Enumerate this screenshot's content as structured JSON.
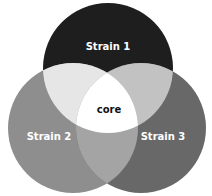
{
  "diagram": {
    "type": "venn-3",
    "sets": [
      {
        "id": "s1",
        "label": "Strain 1",
        "color": "#1e1e1e",
        "label_color": "#ffffff",
        "cx": 108,
        "cy": 68,
        "r": 65
      },
      {
        "id": "s2",
        "label": "Strain 2",
        "color": "#8e8e8e",
        "label_color": "#ffffff",
        "cx": 73,
        "cy": 128,
        "r": 65
      },
      {
        "id": "s3",
        "label": "Strain 3",
        "color": "#686868",
        "label_color": "#ffffff",
        "cx": 141,
        "cy": 128,
        "r": 65
      }
    ],
    "intersections": {
      "s1_s2": {
        "color": "#e6e6e6"
      },
      "s1_s3": {
        "color": "#c2c2c2"
      },
      "s2_s3": {
        "color": "#a4a4a4"
      },
      "core": {
        "label": "core",
        "color": "#ffffff",
        "label_color": "#111111"
      }
    }
  }
}
